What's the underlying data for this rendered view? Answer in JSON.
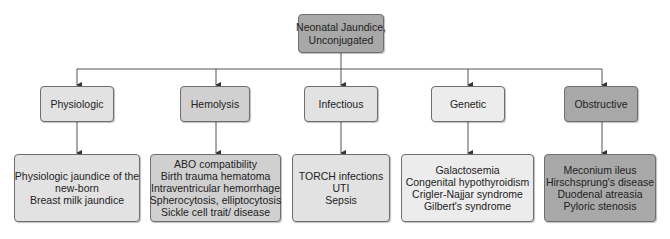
{
  "root": {
    "lines": [
      "Neonatal Jaundice,",
      "Unconjugated"
    ],
    "color": "#a8a8a8"
  },
  "categories": [
    {
      "label": "Physiologic",
      "color": "#e2e2e2",
      "causes": [
        "Physiologic jaundice of the",
        "new-born",
        "Breast milk jaundice"
      ]
    },
    {
      "label": "Hemolysis",
      "color": "#d0d0d0",
      "causes": [
        "ABO compatibility",
        "Birth trauma hematoma",
        "Intraventricular hemorrhage",
        "Spherocytosis, elliptocytosis",
        "Sickle cell trait/ disease"
      ]
    },
    {
      "label": "Infectious",
      "color": "#e2e2e2",
      "causes": [
        "TORCH infections",
        "UTI",
        "Sepsis"
      ]
    },
    {
      "label": "Genetic",
      "color": "#ececec",
      "causes": [
        "Galactosemia",
        "Congenital hypothyroidism",
        "Crigler-Najjar syndrome",
        "Gilbert's syndrome"
      ]
    },
    {
      "label": "Obstructive",
      "color": "#a8a8a8",
      "causes": [
        "Meconium ileus",
        "Hirschsprung's disease",
        "Duodenal atreasia",
        "Pyloric stenosis"
      ]
    }
  ]
}
